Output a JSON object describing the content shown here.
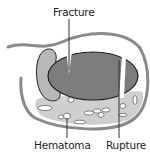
{
  "diagram": {
    "labels": {
      "fracture": "Fracture",
      "rupture": "Rupture",
      "hematoma": "Hematoma"
    },
    "colors": {
      "outline": "#8a8a8a",
      "organ_fill": "#7d7d7d",
      "organ_stroke": "#222222",
      "side_lobe_fill": "#b8b8b8",
      "hematoma_band": "#cfcfcf",
      "clot_fill": "#ffffff",
      "leader_line": "#333333"
    }
  }
}
